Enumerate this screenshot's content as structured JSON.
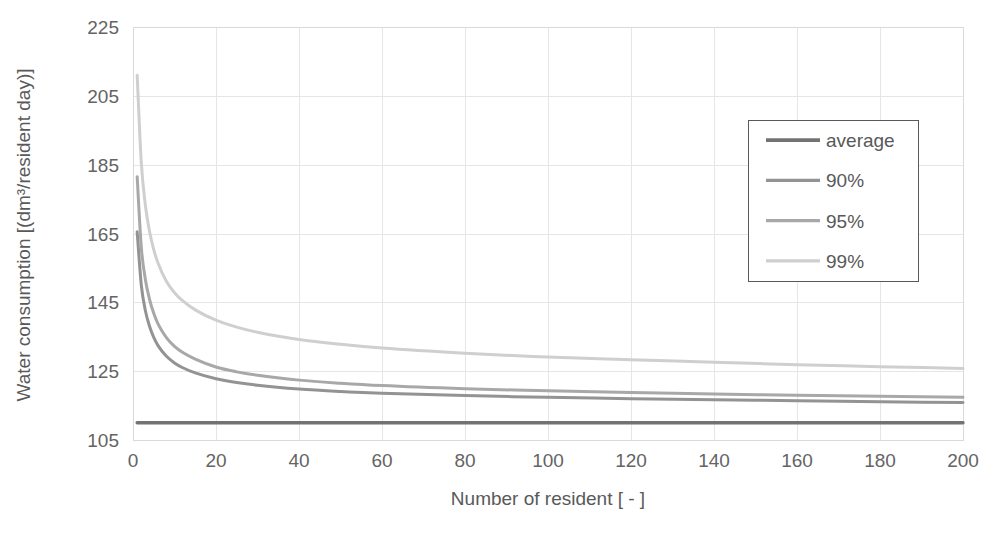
{
  "chart_data": {
    "type": "line",
    "title": "",
    "xlabel": "Number of resident [ - ]",
    "ylabel": "Water consumption [(dm³/resident day)]",
    "xlim": [
      0,
      200
    ],
    "ylim": [
      105,
      225
    ],
    "xticks": [
      0,
      20,
      40,
      60,
      80,
      100,
      120,
      140,
      160,
      180,
      200
    ],
    "yticks": [
      105,
      125,
      145,
      165,
      185,
      205,
      225
    ],
    "grid": true,
    "legend_position": "upper-right",
    "series": [
      {
        "name": "average",
        "color": "#737373",
        "x": [
          1,
          2,
          3,
          4,
          5,
          6,
          8,
          10,
          12,
          15,
          20,
          25,
          30,
          40,
          50,
          60,
          80,
          100,
          120,
          140,
          160,
          180,
          200
        ],
        "values": [
          110,
          110,
          110,
          110,
          110,
          110,
          110,
          110,
          110,
          110,
          110,
          110,
          110,
          110,
          110,
          110,
          110,
          110,
          110,
          110,
          110,
          110,
          110
        ]
      },
      {
        "name": "90%",
        "color": "#939393",
        "x": [
          1,
          2,
          3,
          4,
          5,
          6,
          8,
          10,
          12,
          15,
          20,
          25,
          30,
          40,
          50,
          60,
          80,
          100,
          120,
          140,
          160,
          180,
          200
        ],
        "values": [
          165.5,
          150.0,
          142.5,
          138.0,
          134.8,
          132.5,
          129.4,
          127.4,
          126.0,
          124.5,
          122.8,
          121.7,
          120.9,
          119.8,
          119.1,
          118.6,
          117.9,
          117.4,
          117.0,
          116.7,
          116.4,
          116.1,
          115.9
        ]
      },
      {
        "name": "95%",
        "color": "#a8a8a8",
        "x": [
          1,
          2,
          3,
          4,
          5,
          6,
          8,
          10,
          12,
          15,
          20,
          25,
          30,
          40,
          50,
          60,
          80,
          100,
          120,
          140,
          160,
          180,
          200
        ],
        "values": [
          181.5,
          161.0,
          151.5,
          145.8,
          141.8,
          138.8,
          134.8,
          132.2,
          130.4,
          128.5,
          126.2,
          124.8,
          123.8,
          122.4,
          121.5,
          120.8,
          119.9,
          119.3,
          118.8,
          118.4,
          118.0,
          117.7,
          117.4
        ]
      },
      {
        "name": "99%",
        "color": "#cfcfcf",
        "x": [
          1,
          2,
          3,
          4,
          5,
          6,
          8,
          10,
          12,
          15,
          20,
          25,
          30,
          40,
          50,
          60,
          80,
          100,
          120,
          140,
          160,
          180,
          200
        ],
        "values": [
          211.0,
          185.5,
          173.0,
          165.5,
          160.3,
          156.5,
          151.2,
          147.8,
          145.4,
          142.8,
          139.8,
          137.8,
          136.3,
          134.2,
          132.8,
          131.7,
          130.2,
          129.1,
          128.3,
          127.6,
          126.9,
          126.3,
          125.8
        ]
      }
    ],
    "legend": [
      {
        "label": "average",
        "color": "#737373"
      },
      {
        "label": "90%",
        "color": "#939393"
      },
      {
        "label": "95%",
        "color": "#a8a8a8"
      },
      {
        "label": "99%",
        "color": "#cfcfcf"
      }
    ]
  }
}
